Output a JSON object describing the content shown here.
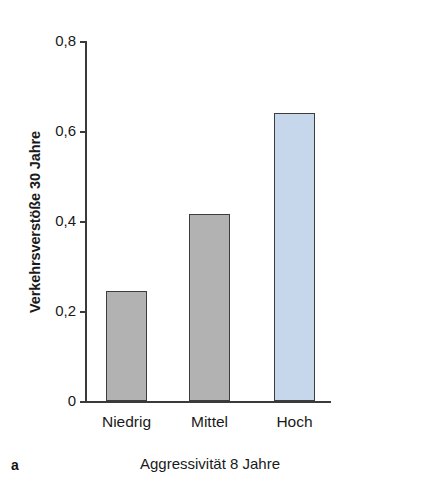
{
  "chart_data": {
    "type": "bar",
    "title": "",
    "subtitle": "",
    "panel_letter": "a",
    "xlabel": "Aggressivität 8 Jahre",
    "ylabel": "Verkehrsverstöße 30 Jahre",
    "categories": [
      "Niedrig",
      "Mittel",
      "Hoch"
    ],
    "values": [
      0.245,
      0.415,
      0.64
    ],
    "ylim": [
      0,
      0.8
    ],
    "yticks": [
      0,
      0.2,
      0.4,
      0.6,
      0.8
    ],
    "ytick_labels": [
      "0",
      "0,2",
      "0,4",
      "0,6",
      "0,8"
    ],
    "grid": false,
    "legend": null,
    "bar_colors": [
      "#b2b2b2",
      "#b2b2b2",
      "#c6d7ec"
    ],
    "bar_edge_color": "#3d3d3d",
    "axis_color": "#3a3a3a"
  },
  "axes": {
    "y_title": "Verkehrsverstöße 30 Jahre",
    "x_title": "Aggressivität 8 Jahre"
  },
  "figure": {
    "panel_label": "a"
  }
}
